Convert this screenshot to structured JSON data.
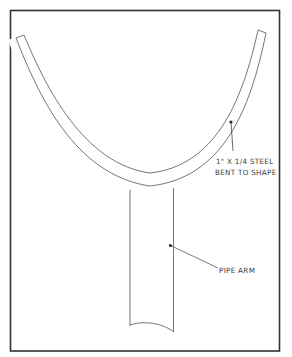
{
  "diagram": {
    "type": "technical-drawing",
    "colors": {
      "line": "#555555",
      "frame": "#333333",
      "background": "#ffffff"
    },
    "labels": {
      "steel_line1": "1\" X 1/4 STEEL",
      "steel_line2": "BENT TO SHAPE",
      "pipe": "PIPE ARM"
    },
    "components": [
      {
        "name": "steel-bar",
        "label": "1\" X 1/4 STEEL BENT TO SHAPE"
      },
      {
        "name": "pipe-arm",
        "label": "PIPE ARM"
      }
    ]
  }
}
